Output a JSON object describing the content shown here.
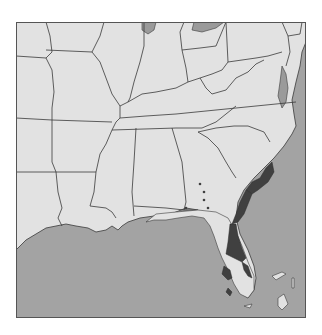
{
  "map": {
    "title": "",
    "region": "Southeastern United States",
    "colors": {
      "land": "#e2e2e2",
      "water": "#a3a3a3",
      "range": "#404040",
      "border": "#3a3a3a",
      "frame": "#555555"
    },
    "features": {
      "range_areas": [
        "South Carolina coast",
        "Georgia coast",
        "Northeast Florida",
        "Central Florida inland patch",
        "East Florida coast"
      ],
      "occurrence_dots": 5,
      "islands": [
        "Bahamas"
      ]
    }
  }
}
